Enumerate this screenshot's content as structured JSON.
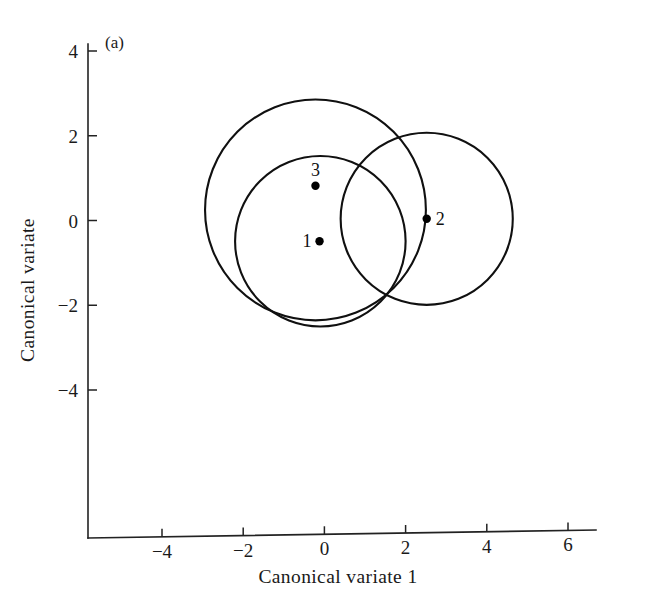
{
  "figure": {
    "panel_label": "(a)",
    "background_color": "#ffffff",
    "line_color": "#101010"
  },
  "chart_data": {
    "type": "scatter",
    "title": "",
    "subtitle": "",
    "xlabel": "Canonical variate 1",
    "ylabel": "Canonical variate",
    "xlim": [
      -5.6,
      6.6
    ],
    "ylim": [
      -5.4,
      4.3
    ],
    "xticks": [
      -4,
      -2,
      0,
      2,
      4,
      6
    ],
    "xtick_labels": [
      "−4",
      "−2",
      "0",
      "2",
      "4",
      "6"
    ],
    "yticks": [
      -4,
      -2,
      0,
      2,
      4
    ],
    "ytick_labels": [
      "−4",
      "−2",
      "0",
      "2",
      "4"
    ],
    "grid": false,
    "legend": "none",
    "annotations": [
      "(a)"
    ],
    "points": [
      {
        "label": "1",
        "x": -0.12,
        "y": -0.49,
        "label_position": "left"
      },
      {
        "label": "2",
        "x": 2.52,
        "y": 0.04,
        "label_position": "right"
      },
      {
        "label": "3",
        "x": -0.22,
        "y": 0.82,
        "label_position": "above"
      }
    ],
    "circles": [
      {
        "name": "group-1-region",
        "cx": -0.1,
        "cy": -0.49,
        "r": 2.1
      },
      {
        "name": "group-2-region",
        "cx": 2.52,
        "cy": 0.04,
        "r": 2.12
      },
      {
        "name": "group-3-region",
        "cx": -0.22,
        "cy": 0.25,
        "r": 2.72
      }
    ]
  }
}
